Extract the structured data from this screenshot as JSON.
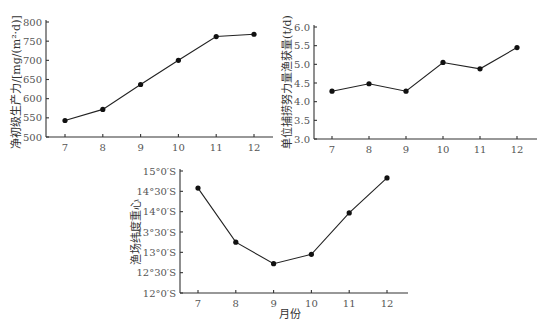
{
  "chart_data": [
    {
      "type": "line",
      "title": "",
      "xlabel": "",
      "ylabel": "净初级生产力/[mg/(m²·d)]",
      "categories": [
        "7",
        "8",
        "9",
        "10",
        "11",
        "12"
      ],
      "values": [
        543,
        572,
        637,
        700,
        762,
        768
      ],
      "ylim": [
        500,
        800
      ],
      "yticks": [
        "500",
        "550",
        "600",
        "650",
        "700",
        "750",
        "800"
      ],
      "grid": false
    },
    {
      "type": "line",
      "title": "",
      "xlabel": "",
      "ylabel": "单位捕捞努力量渔获量(t/d)",
      "categories": [
        "7",
        "8",
        "9",
        "10",
        "11",
        "12"
      ],
      "values": [
        4.28,
        4.48,
        4.28,
        5.05,
        4.88,
        5.45
      ],
      "ylim": [
        3.0,
        6.0
      ],
      "yticks": [
        "3.0",
        "3.5",
        "4.0",
        "4.5",
        "5.0",
        "5.5",
        "6.0"
      ],
      "grid": false
    },
    {
      "type": "line",
      "title": "",
      "xlabel": "月份",
      "ylabel": "渔场纬度重心",
      "categories": [
        "7",
        "8",
        "9",
        "10",
        "11",
        "12"
      ],
      "values": [
        14.58,
        13.25,
        12.72,
        12.95,
        13.97,
        14.83
      ],
      "ylim": [
        12.0,
        15.0
      ],
      "yticks": [
        "12°0′S",
        "12°30′S",
        "13°0′S",
        "13°30′S",
        "14°0′S",
        "14°30′S",
        "15°0′S"
      ],
      "grid": false
    }
  ]
}
